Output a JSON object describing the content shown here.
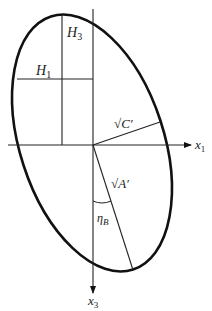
{
  "diagram": {
    "type": "tilted ellipse with axes",
    "stroke_color": "#111111",
    "axes": {
      "horizontal": {
        "label": "x",
        "subscript": "1"
      },
      "vertical": {
        "label": "x",
        "subscript": "3"
      }
    },
    "labels": {
      "h3": {
        "main": "H",
        "sub": "3"
      },
      "h1": {
        "main": "H",
        "sub": "1"
      },
      "sqrt_c": {
        "radical": "√",
        "main": "C′"
      },
      "sqrt_a": {
        "radical": "√",
        "main": "A′"
      },
      "eta_b": {
        "main": "η",
        "sub": "B"
      }
    }
  }
}
